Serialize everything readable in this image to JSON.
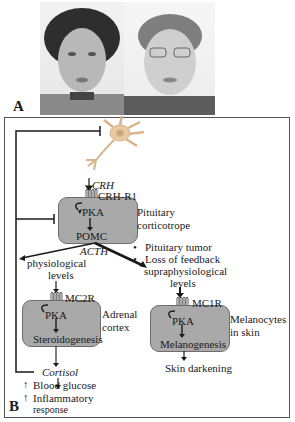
{
  "panel_a": {
    "label": "A",
    "photos": [
      {
        "name": "patient-photo-left",
        "description": "Woman with dark curly hair"
      },
      {
        "name": "patient-photo-right",
        "description": "Woman with short gray hair and glasses"
      }
    ]
  },
  "panel_b": {
    "label": "B",
    "hypothalamus": {
      "signal": "CRH"
    },
    "pituitary": {
      "receptor": "CRH-R1",
      "kinase": "PKA",
      "product": "POMC",
      "cell_label_line1": "Pituitary",
      "cell_label_line2": "corticotrope"
    },
    "acth_label": "ACTH",
    "conditions": [
      "Pituitary tumor",
      "Loss of feedback"
    ],
    "physiological": {
      "line1": "physiological",
      "line2": "levels"
    },
    "supraphysiological": {
      "line1": "supraphysiological",
      "line2": "levels"
    },
    "adrenal": {
      "receptor": "MC2R",
      "kinase": "PKA",
      "process": "Steroidogenesis",
      "cell_label_line1": "Adrenal",
      "cell_label_line2": "cortex",
      "output": "Cortisol",
      "effects": [
        "Blood glucose",
        "Inflammatory",
        "response"
      ]
    },
    "melanocyte": {
      "receptor": "MC1R",
      "kinase": "PKA",
      "process": "Melanogenesis",
      "cell_label_line1": "Melanocytes",
      "cell_label_line2": "in skin",
      "output": "Skin darkening"
    },
    "bullet": "•",
    "up_arrow": "↑"
  },
  "colors": {
    "cell_fill": "#a9a9a9",
    "cell_border": "#6d6d6d",
    "line": "#1a1a1a",
    "neuron": "#e7c9a4"
  }
}
